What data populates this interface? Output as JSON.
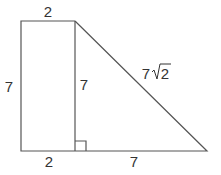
{
  "diagram": {
    "type": "geometry",
    "labels": {
      "top": "2",
      "left": "7",
      "inner_vertical": "7",
      "hypotenuse_coef": "7",
      "hypotenuse_radicand": "2",
      "bottom_left": "2",
      "bottom_right": "7"
    },
    "stroke_color": "#555555"
  }
}
